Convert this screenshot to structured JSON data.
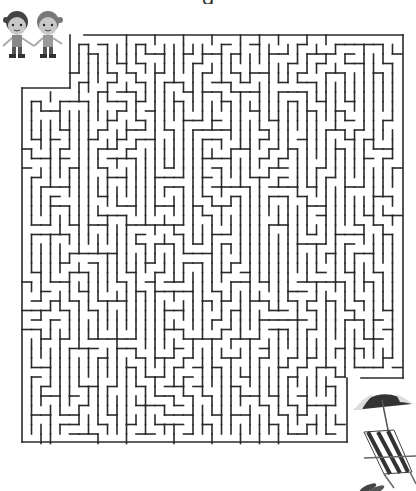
{
  "puzzle": {
    "type": "maze",
    "title": "g",
    "start_label": "kids",
    "goal_label": "beach"
  },
  "maze": {
    "stroke_color": "#2a2a2a",
    "stroke_width": 1.6,
    "outline": [
      [
        70,
        35
      ],
      [
        403,
        35
      ],
      [
        403,
        378
      ],
      [
        347,
        378
      ],
      [
        347,
        442
      ],
      [
        22,
        442
      ],
      [
        22,
        88
      ],
      [
        70,
        88
      ]
    ],
    "entrance": {
      "x": 70,
      "y": 35
    },
    "exit": {
      "x": 347,
      "y": 378
    }
  },
  "illustrations": {
    "start": {
      "name": "two-kids-holding-hands",
      "x": 0,
      "y": 8
    },
    "goal": {
      "name": "beach-umbrella-deck-chair-flip-flops",
      "x": 350,
      "y": 388
    }
  },
  "colors": {
    "background": "#ffffff",
    "walls": "#2a2a2a",
    "umbrella_dark": "#333333",
    "umbrella_light": "#dcdcdc",
    "skin": "#bbbbbb"
  }
}
